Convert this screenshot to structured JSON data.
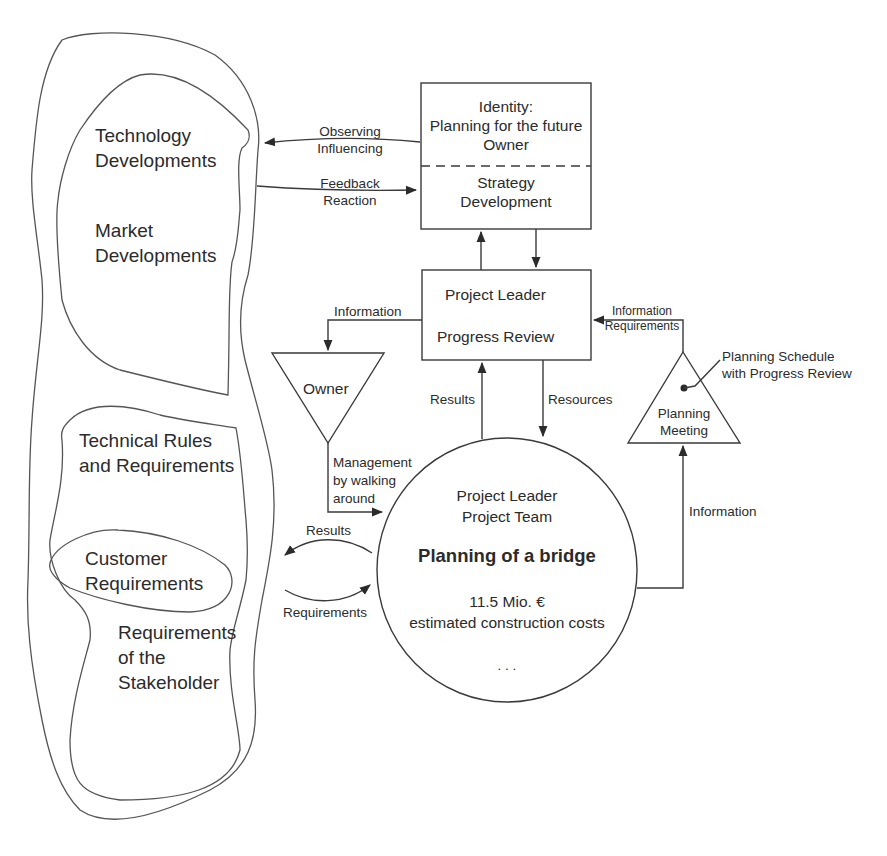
{
  "environment": {
    "technology_developments": "Technology\nDevelopments",
    "technology_line1": "Technology",
    "technology_line2": "Developments",
    "market_line1": "Market",
    "market_line2": "Developments",
    "technical_rules_line1": "Technical Rules",
    "technical_rules_line2": "and Requirements",
    "customer_line1": "Customer",
    "customer_line2": "Requirements",
    "stakeholder_line1": "Requirements",
    "stakeholder_line2": "of the",
    "stakeholder_line3": "Stakeholder"
  },
  "identity_box": {
    "line1": "Identity:",
    "line2": "Planning for the future",
    "line3": "Owner",
    "lower_line1": "Strategy",
    "lower_line2": "Development"
  },
  "project_leader_box": {
    "line1": "Project Leader",
    "line2": "Progress Review"
  },
  "owner_triangle": {
    "label": "Owner"
  },
  "planning_meeting": {
    "line1": "Planning",
    "line2": "Meeting",
    "callout_line1": "Planning Schedule",
    "callout_line2": "with Progress Review"
  },
  "project_circle": {
    "line1": "Project Leader",
    "line2": "Project Team",
    "title": "Planning of a bridge",
    "cost_line1": "11.5 Mio. €",
    "cost_line2": "estimated construction costs",
    "ellipsis": ". . ."
  },
  "arrows": {
    "observing": "Observing",
    "influencing": "Influencing",
    "feedback": "Feedback",
    "reaction": "Reaction",
    "information_to_owner": "Information",
    "info_req_line1": "Information",
    "info_req_line2": "Requirements",
    "results_up": "Results",
    "resources_down": "Resources",
    "management_line1": "Management",
    "management_line2": "by walking",
    "management_line3": "around",
    "results_left": "Results",
    "requirements_right": "Requirements",
    "information_up": "Information"
  },
  "colors": {
    "line": "#3a3a3a",
    "text": "#2b2b2b",
    "background": "#ffffff"
  }
}
